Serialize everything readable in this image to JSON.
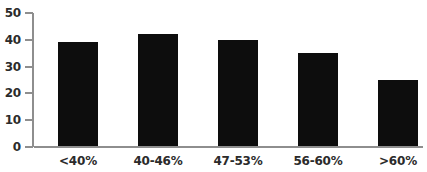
{
  "chart_data": {
    "type": "bar",
    "title": "",
    "subtitle": "",
    "xlabel": "",
    "ylabel": "",
    "categories": [
      "<40%",
      "40-46%",
      "47-53%",
      "56-60%",
      ">60%"
    ],
    "values": [
      39,
      42,
      40,
      35,
      25
    ],
    "series": [
      {
        "name": "",
        "values": [
          39,
          42,
          40,
          35,
          25
        ]
      }
    ],
    "ylim": [
      0,
      50
    ],
    "y_ticks": [
      0,
      10,
      20,
      30,
      40,
      50
    ],
    "y_tick_labels": [
      "0",
      "10",
      "20",
      "30",
      "40",
      "50"
    ],
    "grid": false,
    "legend": false,
    "legend_position": "none",
    "annotations": [],
    "colors": {
      "bar_fill": "#0d0d0d",
      "axis_line": "#8e8e8e",
      "tick_label": "#2b2b2b",
      "background": "#ffffff"
    }
  }
}
